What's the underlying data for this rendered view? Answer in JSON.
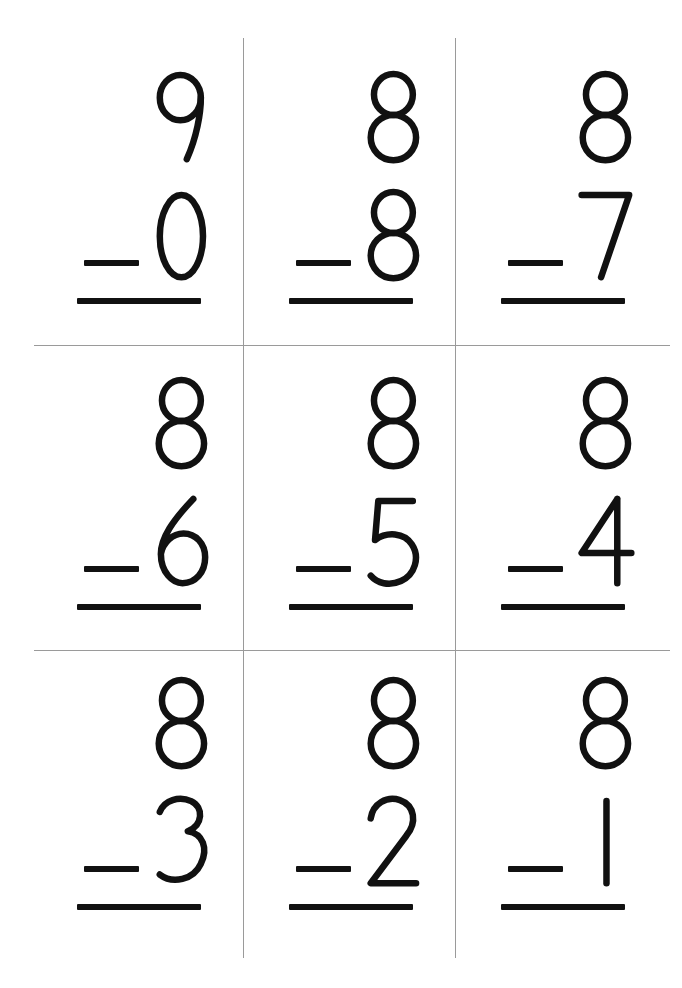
{
  "worksheet": {
    "title": "Subtraction Flash Card Worksheet",
    "background_color": "#ffffff",
    "ink_color": "#111111",
    "rule_color": "#9a9a9a",
    "columns": 3,
    "rows": 3,
    "operator_symbol": "−"
  },
  "problems": [
    {
      "id": "p1",
      "minuend": "9",
      "subtrahend": "0",
      "operator": "−",
      "answer": ""
    },
    {
      "id": "p2",
      "minuend": "8",
      "subtrahend": "8",
      "operator": "−",
      "answer": ""
    },
    {
      "id": "p3",
      "minuend": "8",
      "subtrahend": "7",
      "operator": "−",
      "answer": ""
    },
    {
      "id": "p4",
      "minuend": "8",
      "subtrahend": "6",
      "operator": "−",
      "answer": ""
    },
    {
      "id": "p5",
      "minuend": "8",
      "subtrahend": "5",
      "operator": "−",
      "answer": ""
    },
    {
      "id": "p6",
      "minuend": "8",
      "subtrahend": "4",
      "operator": "−",
      "answer": ""
    },
    {
      "id": "p7",
      "minuend": "8",
      "subtrahend": "3",
      "operator": "−",
      "answer": ""
    },
    {
      "id": "p8",
      "minuend": "8",
      "subtrahend": "2",
      "operator": "−",
      "answer": ""
    },
    {
      "id": "p9",
      "minuend": "8",
      "subtrahend": "1",
      "operator": "−",
      "answer": ""
    }
  ]
}
